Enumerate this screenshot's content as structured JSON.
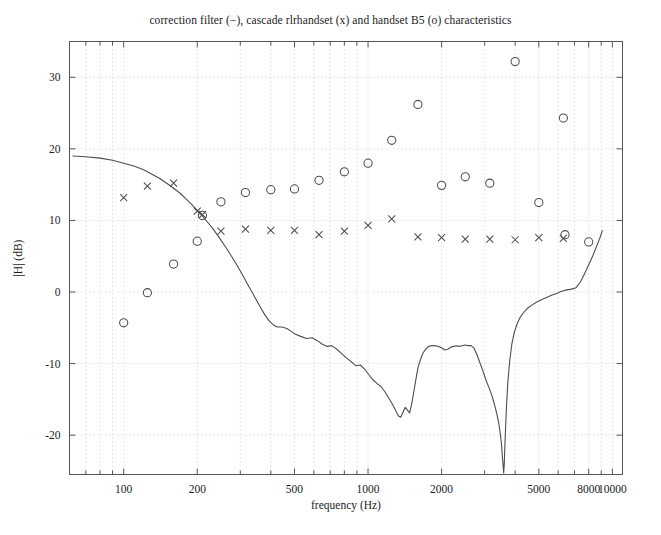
{
  "figure": {
    "title": "correction filter (−), cascade rlrhandset (x) and handset B5 (o) characteristics",
    "background_color": "#ffffff",
    "axes_color": "#555555",
    "grid_color": "#bfbfbf",
    "data_color": "#4d4d4d"
  },
  "chart_data": {
    "type": "line",
    "title": "correction filter (−), cascade rlrhandset (x) and handset B5 (o) characteristics",
    "xlabel": "frequency (Hz)",
    "ylabel": "|H| (dB)",
    "xscale": "log",
    "yscale": "linear",
    "xlim": [
      60,
      11000
    ],
    "ylim": [
      -25.5,
      35
    ],
    "grid": true,
    "legend_position": "none",
    "x_tick_values": [
      100,
      200,
      500,
      1000,
      2000,
      5000,
      8000,
      10000
    ],
    "x_tick_labels": [
      "100",
      "200",
      "500",
      "1000",
      "2000",
      "5000",
      "8000",
      "10000"
    ],
    "x_minor_ticks": [
      70,
      80,
      90,
      300,
      400,
      600,
      700,
      800,
      900,
      3000,
      4000,
      6000,
      7000,
      9000
    ],
    "y_tick_values": [
      30,
      20,
      10,
      0,
      -10,
      -20
    ],
    "y_tick_labels": [
      "30",
      "20",
      "10",
      "0",
      "-10",
      "-20"
    ],
    "series": [
      {
        "name": "correction filter",
        "marker": "-",
        "style": "line",
        "points": [
          [
            62,
            19.0
          ],
          [
            70,
            18.9
          ],
          [
            80,
            18.7
          ],
          [
            90,
            18.4
          ],
          [
            100,
            18.0
          ],
          [
            110,
            17.6
          ],
          [
            120,
            17.1
          ],
          [
            130,
            16.5
          ],
          [
            140,
            15.9
          ],
          [
            150,
            15.2
          ],
          [
            160,
            14.5
          ],
          [
            170,
            13.8
          ],
          [
            180,
            13.0
          ],
          [
            190,
            12.2
          ],
          [
            200,
            11.4
          ],
          [
            215,
            10.2
          ],
          [
            230,
            9.0
          ],
          [
            245,
            7.7
          ],
          [
            260,
            6.4
          ],
          [
            275,
            5.1
          ],
          [
            290,
            3.8
          ],
          [
            305,
            2.5
          ],
          [
            320,
            1.2
          ],
          [
            335,
            0.0
          ],
          [
            350,
            -1.2
          ],
          [
            365,
            -2.3
          ],
          [
            380,
            -3.3
          ],
          [
            395,
            -4.1
          ],
          [
            410,
            -4.6
          ],
          [
            425,
            -4.9
          ],
          [
            445,
            -4.9
          ],
          [
            465,
            -5.1
          ],
          [
            485,
            -5.5
          ],
          [
            505,
            -5.9
          ],
          [
            530,
            -6.2
          ],
          [
            560,
            -6.5
          ],
          [
            590,
            -6.4
          ],
          [
            620,
            -6.8
          ],
          [
            650,
            -7.3
          ],
          [
            680,
            -7.6
          ],
          [
            710,
            -7.5
          ],
          [
            745,
            -8.0
          ],
          [
            780,
            -8.6
          ],
          [
            815,
            -9.2
          ],
          [
            850,
            -9.7
          ],
          [
            890,
            -10.3
          ],
          [
            930,
            -10.2
          ],
          [
            970,
            -10.8
          ],
          [
            1010,
            -11.6
          ],
          [
            1050,
            -12.3
          ],
          [
            1090,
            -12.8
          ],
          [
            1130,
            -13.2
          ],
          [
            1170,
            -13.9
          ],
          [
            1210,
            -14.7
          ],
          [
            1250,
            -15.5
          ],
          [
            1290,
            -16.4
          ],
          [
            1330,
            -17.3
          ],
          [
            1360,
            -17.5
          ],
          [
            1390,
            -16.8
          ],
          [
            1420,
            -16.1
          ],
          [
            1450,
            -16.5
          ],
          [
            1480,
            -16.9
          ],
          [
            1510,
            -15.6
          ],
          [
            1540,
            -13.9
          ],
          [
            1570,
            -12.2
          ],
          [
            1600,
            -10.6
          ],
          [
            1640,
            -9.4
          ],
          [
            1680,
            -8.5
          ],
          [
            1720,
            -8.0
          ],
          [
            1770,
            -7.6
          ],
          [
            1820,
            -7.5
          ],
          [
            1880,
            -7.5
          ],
          [
            1940,
            -7.6
          ],
          [
            2000,
            -7.8
          ],
          [
            2060,
            -8.1
          ],
          [
            2120,
            -8.0
          ],
          [
            2180,
            -7.7
          ],
          [
            2240,
            -7.6
          ],
          [
            2300,
            -7.5
          ],
          [
            2360,
            -7.6
          ],
          [
            2430,
            -7.5
          ],
          [
            2500,
            -7.4
          ],
          [
            2570,
            -7.5
          ],
          [
            2640,
            -7.5
          ],
          [
            2710,
            -7.8
          ],
          [
            2780,
            -8.6
          ],
          [
            2850,
            -9.6
          ],
          [
            2920,
            -10.6
          ],
          [
            2990,
            -11.6
          ],
          [
            3060,
            -12.6
          ],
          [
            3130,
            -13.4
          ],
          [
            3200,
            -14.3
          ],
          [
            3260,
            -15.2
          ],
          [
            3320,
            -16.2
          ],
          [
            3380,
            -17.3
          ],
          [
            3430,
            -18.4
          ],
          [
            3470,
            -19.6
          ],
          [
            3510,
            -21.0
          ],
          [
            3540,
            -22.6
          ],
          [
            3570,
            -24.2
          ],
          [
            3590,
            -25.3
          ],
          [
            3610,
            -24.0
          ],
          [
            3640,
            -20.5
          ],
          [
            3680,
            -16.5
          ],
          [
            3730,
            -12.8
          ],
          [
            3800,
            -9.6
          ],
          [
            3880,
            -7.2
          ],
          [
            3970,
            -5.6
          ],
          [
            4080,
            -4.4
          ],
          [
            4200,
            -3.5
          ],
          [
            4350,
            -2.8
          ],
          [
            4520,
            -2.2
          ],
          [
            4700,
            -1.8
          ],
          [
            4900,
            -1.4
          ],
          [
            5120,
            -1.1
          ],
          [
            5350,
            -0.8
          ],
          [
            5600,
            -0.5
          ],
          [
            5900,
            -0.2
          ],
          [
            6200,
            0.1
          ],
          [
            6500,
            0.3
          ],
          [
            6800,
            0.4
          ],
          [
            7100,
            0.6
          ],
          [
            7400,
            1.4
          ],
          [
            7700,
            2.6
          ],
          [
            8000,
            3.8
          ],
          [
            8300,
            5.0
          ],
          [
            8600,
            6.3
          ],
          [
            8900,
            7.6
          ],
          [
            9100,
            8.6
          ]
        ]
      },
      {
        "name": "cascade rlrhandset",
        "marker": "x",
        "style": "scatter",
        "points": [
          [
            100,
            13.2
          ],
          [
            125,
            14.8
          ],
          [
            160,
            15.2
          ],
          [
            200,
            11.3
          ],
          [
            210,
            10.8
          ],
          [
            250,
            8.5
          ],
          [
            315,
            8.8
          ],
          [
            400,
            8.6
          ],
          [
            500,
            8.6
          ],
          [
            630,
            8.0
          ],
          [
            800,
            8.5
          ],
          [
            1000,
            9.3
          ],
          [
            1250,
            10.2
          ],
          [
            1600,
            7.7
          ],
          [
            2000,
            7.6
          ],
          [
            2500,
            7.4
          ],
          [
            3150,
            7.4
          ],
          [
            4000,
            7.3
          ],
          [
            5000,
            7.6
          ],
          [
            6300,
            7.5
          ]
        ]
      },
      {
        "name": "handset B5",
        "marker": "o",
        "style": "scatter",
        "points": [
          [
            100,
            -4.3
          ],
          [
            125,
            -0.1
          ],
          [
            160,
            3.9
          ],
          [
            200,
            7.1
          ],
          [
            210,
            10.7
          ],
          [
            250,
            12.6
          ],
          [
            315,
            13.9
          ],
          [
            400,
            14.3
          ],
          [
            500,
            14.4
          ],
          [
            630,
            15.6
          ],
          [
            800,
            16.8
          ],
          [
            1000,
            18.0
          ],
          [
            1250,
            21.2
          ],
          [
            1600,
            26.2
          ],
          [
            2000,
            14.9
          ],
          [
            2500,
            16.1
          ],
          [
            3150,
            15.2
          ],
          [
            4000,
            32.2
          ],
          [
            5000,
            12.5
          ],
          [
            6300,
            24.3
          ],
          [
            6400,
            8.0
          ],
          [
            8000,
            7.0
          ]
        ]
      }
    ]
  },
  "axes": {
    "xlabel": "frequency (Hz)",
    "ylabel": "|H| (dB)"
  }
}
